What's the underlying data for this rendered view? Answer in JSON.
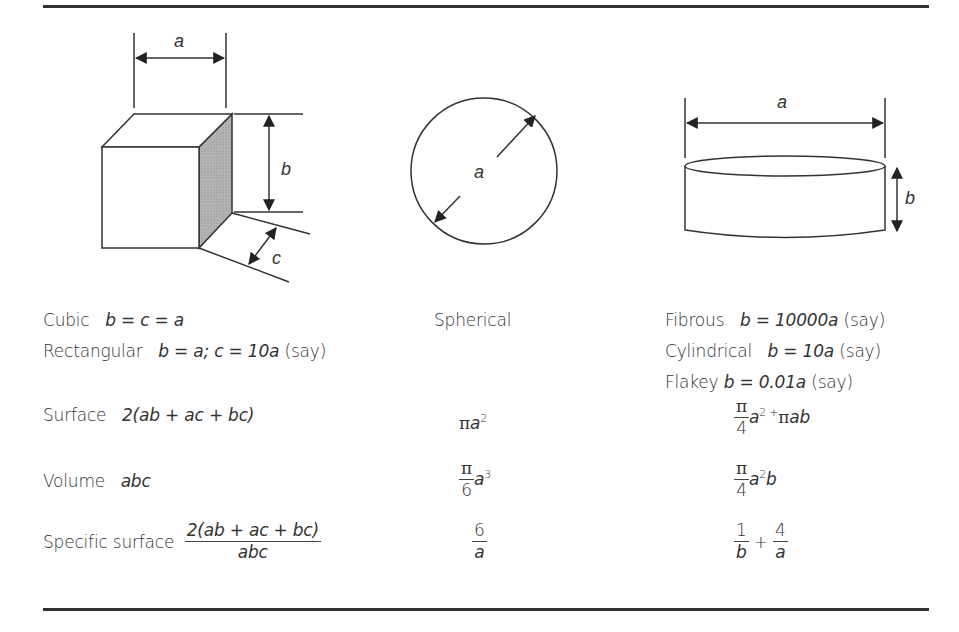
{
  "figure": {
    "shapes": [
      {
        "id": "cube",
        "dimension_labels": [
          "a",
          "b",
          "c"
        ]
      },
      {
        "id": "sphere",
        "dimension_labels": [
          "a"
        ]
      },
      {
        "id": "cylinder",
        "dimension_labels": [
          "a",
          "b"
        ]
      }
    ],
    "colors": {
      "line": "#333333",
      "shade": "#a8a8a8",
      "rule": "#333333"
    }
  },
  "columns": {
    "col1": {
      "cubic_label": "Cubic",
      "cubic_eq": "b = c = a",
      "rect_label": "Rectangular",
      "rect_eq_1": "b = a; c = 10",
      "rect_eq_a": "a",
      "rect_say": "(say)"
    },
    "col2": {
      "spherical_label": "Spherical"
    },
    "col3": {
      "fibrous_label": "Fibrous",
      "fibrous_eq": "b = 10000",
      "fibrous_a": "a",
      "fibrous_say": "(say)",
      "cyl_label": "Cylindrical",
      "cyl_eq": "b = 10",
      "cyl_a": "a",
      "cyl_say": "(say)",
      "flakey_label": "Flakey",
      "flakey_eq": "b = 0.01",
      "flakey_a": "a",
      "flakey_say": "(say)"
    }
  },
  "rows": {
    "surface": {
      "label": "Surface",
      "cube": "2(ab + ac + bc)",
      "sphere_pi": "π",
      "sphere_a": "a",
      "sphere_exp": "2",
      "cyl_num": "π",
      "cyl_den": "4",
      "cyl_a": "a",
      "cyl_exp": "2 +",
      "cyl_pi": "π",
      "cyl_ab": "ab"
    },
    "volume": {
      "label": "Volume",
      "cube": "abc",
      "sphere_num": "π",
      "sphere_den": "6",
      "sphere_a": "a",
      "sphere_exp": "3",
      "cyl_num": "π",
      "cyl_den": "4",
      "cyl_a": "a",
      "cyl_exp": "2",
      "cyl_b": "b"
    },
    "specific_surface": {
      "label": "Specific surface",
      "cube_num": "2(ab + ac + bc)",
      "cube_den": "abc",
      "sphere_num": "6",
      "sphere_den": "a",
      "cyl_num1": "1",
      "cyl_den1": "b",
      "cyl_plus": "+",
      "cyl_num2": "4",
      "cyl_den2": "a"
    }
  }
}
